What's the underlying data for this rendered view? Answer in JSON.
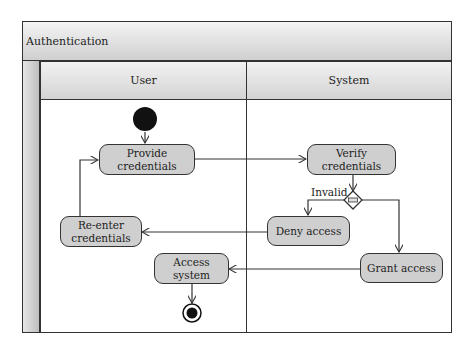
{
  "diagram": {
    "type": "uml-activity-diagram",
    "title": "Authentication",
    "lanes": [
      {
        "id": "user",
        "label": "User"
      },
      {
        "id": "system",
        "label": "System"
      }
    ],
    "nodes": {
      "start": {
        "kind": "initial",
        "lane": "user"
      },
      "provide_credentials": {
        "kind": "action",
        "lane": "user",
        "label": "Provide credentials"
      },
      "verify_credentials": {
        "kind": "action",
        "lane": "system",
        "label": "Verify credentials"
      },
      "decision": {
        "kind": "decision",
        "lane": "system"
      },
      "deny_access": {
        "kind": "action",
        "lane": "system",
        "label": "Deny access"
      },
      "reenter_credentials": {
        "kind": "action",
        "lane": "user",
        "label_line1": "Re-enter",
        "label_line2": "credentials"
      },
      "grant_access": {
        "kind": "action",
        "lane": "system",
        "label": "Grant access"
      },
      "access_system": {
        "kind": "action",
        "lane": "user",
        "label": "Access system"
      },
      "end": {
        "kind": "final",
        "lane": "user"
      }
    },
    "edges": [
      {
        "from": "start",
        "to": "provide_credentials"
      },
      {
        "from": "provide_credentials",
        "to": "verify_credentials"
      },
      {
        "from": "verify_credentials",
        "to": "decision"
      },
      {
        "from": "decision",
        "to": "deny_access",
        "guard": "Invalid"
      },
      {
        "from": "decision",
        "to": "grant_access"
      },
      {
        "from": "deny_access",
        "to": "reenter_credentials"
      },
      {
        "from": "reenter_credentials",
        "to": "provide_credentials"
      },
      {
        "from": "grant_access",
        "to": "access_system"
      },
      {
        "from": "access_system",
        "to": "end"
      }
    ],
    "colors": {
      "node_fill": "#cfcfcf",
      "stroke": "#333333",
      "header_light": "#f2f2f2",
      "header_dark": "#d3d3d3"
    }
  }
}
